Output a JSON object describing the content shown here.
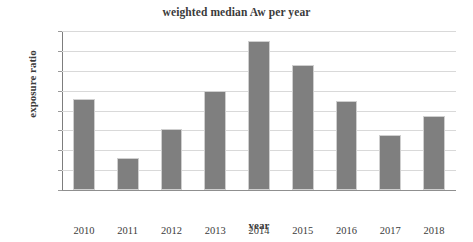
{
  "chart_data": {
    "type": "bar",
    "title": "weighted median Aw per year",
    "xlabel": "year",
    "ylabel": "exposure ratio",
    "categories": [
      "2010",
      "2011",
      "2012",
      "2013",
      "2014",
      "2015",
      "2016",
      "2017",
      "2018"
    ],
    "values": [
      0.046,
      0.016,
      0.0305,
      0.05,
      0.075,
      0.063,
      0.045,
      0.0277,
      0.0373
    ],
    "ylim": [
      0.0,
      0.08
    ],
    "ytick_labels": [
      "0.08",
      "0.07",
      "0.06",
      "0.05",
      "0.04",
      "0.03",
      "0.02",
      "0.01",
      "0.00"
    ],
    "ytick_values": [
      0.08,
      0.07,
      0.06,
      0.05,
      0.04,
      0.03,
      0.02,
      0.01,
      0.0
    ],
    "grid": true,
    "legend": false,
    "series": [
      {
        "name": "weighted median Aw",
        "color": "#7f7f7f",
        "values": [
          0.046,
          0.016,
          0.0305,
          0.05,
          0.075,
          0.063,
          0.045,
          0.0277,
          0.0373
        ]
      }
    ],
    "colors": {
      "bar": "#7f7f7f",
      "gridline": "#d9d9d9",
      "axis": "#8f8f8f",
      "text": "#3b3b3b",
      "background": "#ffffff"
    }
  }
}
